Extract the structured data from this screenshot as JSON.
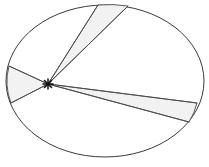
{
  "figure": {
    "background_color": "#ffffff",
    "outline_color": "#3a3a3a",
    "chord_color": "#4a4a4a",
    "sector_fill_color": "#f2f2f2",
    "vertex_color": "#111111"
  },
  "chart_data": {
    "type": "diagram",
    "xlabel": "",
    "ylabel": "",
    "xlim": [
      0,
      209
    ],
    "ylim": [
      0,
      167
    ],
    "grid": false,
    "legend": null,
    "annotations": [],
    "ellipse": {
      "center_x": 105,
      "center_y": 81,
      "radius_x": 99,
      "radius_y": 76,
      "stroke": "#3a3a3a",
      "stroke_width": 1,
      "fill": "#ffffff"
    },
    "vertex": {
      "label": "interior point",
      "x": 48,
      "y": 84,
      "marker": "asterisk",
      "color": "#111111"
    },
    "rays": [
      {
        "name": "ray-upper-left",
        "end_x": 98,
        "end_y": 5
      },
      {
        "name": "ray-upper-right",
        "end_x": 128,
        "end_y": 6
      },
      {
        "name": "ray-west-upper",
        "end_x": 9,
        "end_y": 66
      },
      {
        "name": "ray-west-lower",
        "end_x": 11,
        "end_y": 103
      },
      {
        "name": "ray-east-upper",
        "end_x": 197,
        "end_y": 103
      },
      {
        "name": "ray-east-lower",
        "end_x": 189,
        "end_y": 122
      }
    ],
    "sectors": [
      {
        "name": "sector-top",
        "fill": "#f2f2f2",
        "edge_a": "ray-upper-left",
        "edge_b": "ray-upper-right",
        "arc_from_x": 98,
        "arc_from_y": 5,
        "arc_to_x": 128,
        "arc_to_y": 6
      },
      {
        "name": "sector-west",
        "fill": "#f2f2f2",
        "edge_a": "ray-west-upper",
        "edge_b": "ray-west-lower",
        "arc_from_x": 9,
        "arc_from_y": 66,
        "arc_to_x": 11,
        "arc_to_y": 103
      },
      {
        "name": "sector-east",
        "fill": "#f2f2f2",
        "edge_a": "ray-east-upper",
        "edge_b": "ray-east-lower",
        "arc_from_x": 197,
        "arc_from_y": 103,
        "arc_to_x": 189,
        "arc_to_y": 122
      }
    ],
    "sector_count": 3,
    "ray_count": 6
  }
}
